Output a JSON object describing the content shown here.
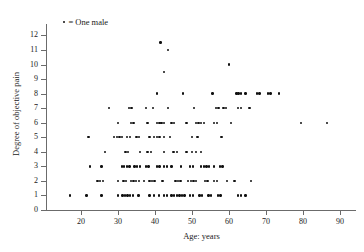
{
  "legend": {
    "marker": "dot-marker",
    "text": "= One male"
  },
  "chart_data": {
    "type": "scatter",
    "title": "",
    "xlabel": "Age: years",
    "ylabel": "Degree of objective pain",
    "xlim": [
      15,
      91
    ],
    "ylim": [
      0,
      12
    ],
    "xticks": [
      20,
      30,
      40,
      50,
      60,
      70,
      80,
      90
    ],
    "yticks": [
      0,
      1,
      2,
      3,
      4,
      5,
      6,
      7,
      8,
      9,
      10,
      11,
      12
    ],
    "grid": false,
    "legend_position": "top-left",
    "marker_note": "each dot = one male",
    "points": [
      [
        41.5,
        11.5
      ],
      [
        43.5,
        11.0
      ],
      [
        42.5,
        9.5
      ],
      [
        60.0,
        10.0
      ],
      [
        40.5,
        8.0
      ],
      [
        47.5,
        8.0
      ],
      [
        55.5,
        8.0
      ],
      [
        62.0,
        8.0
      ],
      [
        62.6,
        8.0
      ],
      [
        63.2,
        8.0
      ],
      [
        64.5,
        8.0
      ],
      [
        67.5,
        8.0
      ],
      [
        68.2,
        8.0
      ],
      [
        70.5,
        8.0
      ],
      [
        71.2,
        8.0
      ],
      [
        73.5,
        8.0
      ],
      [
        27.5,
        7.0
      ],
      [
        33.0,
        7.0
      ],
      [
        33.6,
        7.0
      ],
      [
        37.5,
        7.0
      ],
      [
        39.5,
        7.0
      ],
      [
        43.5,
        7.0
      ],
      [
        50.5,
        7.0
      ],
      [
        56.5,
        7.0
      ],
      [
        57.2,
        7.0
      ],
      [
        58.5,
        7.0
      ],
      [
        59.2,
        7.0
      ],
      [
        62.5,
        7.0
      ],
      [
        63.2,
        7.0
      ],
      [
        65.5,
        7.0
      ],
      [
        30.0,
        6.0
      ],
      [
        33.5,
        6.0
      ],
      [
        34.2,
        6.0
      ],
      [
        38.0,
        6.0
      ],
      [
        40.5,
        6.0
      ],
      [
        41.2,
        6.0
      ],
      [
        41.8,
        6.0
      ],
      [
        42.5,
        6.0
      ],
      [
        44.5,
        6.0
      ],
      [
        45.2,
        6.0
      ],
      [
        48.5,
        6.0
      ],
      [
        51.0,
        6.0
      ],
      [
        51.8,
        6.0
      ],
      [
        52.5,
        6.0
      ],
      [
        53.2,
        6.0
      ],
      [
        56.0,
        6.0
      ],
      [
        56.8,
        6.0
      ],
      [
        60.5,
        6.0
      ],
      [
        79.5,
        6.0
      ],
      [
        22.0,
        5.0
      ],
      [
        29.0,
        5.0
      ],
      [
        29.7,
        5.0
      ],
      [
        30.4,
        5.0
      ],
      [
        31.1,
        5.0
      ],
      [
        32.5,
        5.0
      ],
      [
        33.2,
        5.0
      ],
      [
        35.0,
        5.0
      ],
      [
        35.7,
        5.0
      ],
      [
        38.5,
        5.0
      ],
      [
        39.8,
        5.0
      ],
      [
        40.5,
        5.0
      ],
      [
        41.2,
        5.0
      ],
      [
        42.5,
        5.0
      ],
      [
        44.0,
        5.0
      ],
      [
        50.0,
        5.0
      ],
      [
        51.5,
        5.0
      ],
      [
        58.0,
        5.0
      ],
      [
        26.5,
        4.0
      ],
      [
        32.0,
        4.0
      ],
      [
        32.7,
        4.0
      ],
      [
        36.0,
        4.0
      ],
      [
        38.0,
        4.0
      ],
      [
        39.0,
        4.0
      ],
      [
        42.5,
        4.0
      ],
      [
        45.0,
        4.0
      ],
      [
        46.0,
        4.0
      ],
      [
        48.5,
        4.0
      ],
      [
        50.0,
        4.0
      ],
      [
        51.0,
        4.0
      ],
      [
        52.5,
        4.0
      ],
      [
        22.5,
        3.0
      ],
      [
        25.5,
        3.0
      ],
      [
        31.0,
        3.0
      ],
      [
        31.7,
        3.0
      ],
      [
        32.4,
        3.0
      ],
      [
        33.1,
        3.0
      ],
      [
        34.5,
        3.0
      ],
      [
        35.2,
        3.0
      ],
      [
        35.9,
        3.0
      ],
      [
        37.5,
        3.0
      ],
      [
        38.2,
        3.0
      ],
      [
        40.5,
        3.0
      ],
      [
        41.2,
        3.0
      ],
      [
        42.5,
        3.0
      ],
      [
        43.2,
        3.0
      ],
      [
        44.5,
        3.0
      ],
      [
        47.0,
        3.0
      ],
      [
        49.5,
        3.0
      ],
      [
        50.2,
        3.0
      ],
      [
        52.5,
        3.0
      ],
      [
        53.2,
        3.0
      ],
      [
        53.9,
        3.0
      ],
      [
        54.6,
        3.0
      ],
      [
        56.0,
        3.0
      ],
      [
        57.5,
        3.0
      ],
      [
        58.2,
        3.0
      ],
      [
        24.5,
        2.0
      ],
      [
        25.2,
        2.0
      ],
      [
        25.9,
        2.0
      ],
      [
        30.0,
        2.0
      ],
      [
        31.5,
        2.0
      ],
      [
        32.2,
        2.0
      ],
      [
        33.5,
        2.0
      ],
      [
        34.2,
        2.0
      ],
      [
        34.9,
        2.0
      ],
      [
        35.6,
        2.0
      ],
      [
        37.0,
        2.0
      ],
      [
        38.5,
        2.0
      ],
      [
        39.2,
        2.0
      ],
      [
        39.9,
        2.0
      ],
      [
        42.0,
        2.0
      ],
      [
        45.5,
        2.0
      ],
      [
        46.2,
        2.0
      ],
      [
        46.9,
        2.0
      ],
      [
        49.0,
        2.0
      ],
      [
        49.7,
        2.0
      ],
      [
        50.4,
        2.0
      ],
      [
        51.1,
        2.0
      ],
      [
        53.5,
        2.0
      ],
      [
        54.2,
        2.0
      ],
      [
        56.0,
        2.0
      ],
      [
        56.7,
        2.0
      ],
      [
        59.5,
        2.0
      ],
      [
        61.5,
        2.0
      ],
      [
        66.0,
        2.0
      ],
      [
        17.0,
        1.0
      ],
      [
        21.5,
        1.0
      ],
      [
        25.5,
        1.0
      ],
      [
        30.0,
        1.0
      ],
      [
        31.2,
        1.0
      ],
      [
        31.9,
        1.0
      ],
      [
        32.6,
        1.0
      ],
      [
        33.3,
        1.0
      ],
      [
        34.0,
        1.0
      ],
      [
        35.5,
        1.0
      ],
      [
        38.5,
        1.0
      ],
      [
        39.8,
        1.0
      ],
      [
        41.0,
        1.0
      ],
      [
        42.5,
        1.0
      ],
      [
        43.2,
        1.0
      ],
      [
        44.5,
        1.0
      ],
      [
        45.2,
        1.0
      ],
      [
        45.9,
        1.0
      ],
      [
        46.6,
        1.0
      ],
      [
        47.3,
        1.0
      ],
      [
        48.0,
        1.0
      ],
      [
        49.5,
        1.0
      ],
      [
        50.2,
        1.0
      ],
      [
        52.0,
        1.0
      ],
      [
        52.7,
        1.0
      ],
      [
        54.5,
        1.0
      ],
      [
        55.2,
        1.0
      ],
      [
        57.0,
        1.0
      ],
      [
        57.7,
        1.0
      ],
      [
        62.5,
        1.0
      ],
      [
        63.2,
        1.0
      ],
      [
        64.5,
        1.0
      ],
      [
        86.5,
        6.0
      ]
    ]
  }
}
